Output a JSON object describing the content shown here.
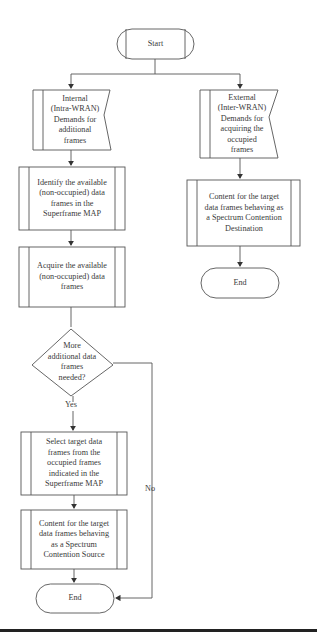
{
  "flowchart": {
    "start": {
      "label": "Start"
    },
    "left_branch": {
      "input": {
        "label": "Internal\n(Intra-WRAN)\nDemands for\nadditional\nframes"
      },
      "identify": {
        "label": "Identify the available\n(non-occupied) data\nframes in the\nSuperframe MAP"
      },
      "acquire": {
        "label": "Acquire the available\n(non-occupied) data\nframes"
      },
      "decision": {
        "label": "More\nadditional data\nframes\nneeded?"
      },
      "yes_label": "Yes",
      "no_label": "No",
      "select": {
        "label": "Select target data\nframes from the\noccupied frames\nindicated in the\nSuperframe MAP"
      },
      "contend_source": {
        "label": "Content for the target\ndata frames behaving\nas a Spectrum\nContention Source"
      },
      "end": {
        "label": "End"
      }
    },
    "right_branch": {
      "input": {
        "label": "External\n(Inter-WRAN)\nDemands for\nacquiring the\noccupied\nframes"
      },
      "contend_destination": {
        "label": "Content for the target\ndata frames behaving as\na Spectrum Contention\nDestination"
      },
      "end": {
        "label": "End"
      }
    }
  },
  "colors": {
    "stroke": "#555555",
    "text": "#3a3a3a",
    "background": "#ffffff",
    "rule": "#222222"
  }
}
